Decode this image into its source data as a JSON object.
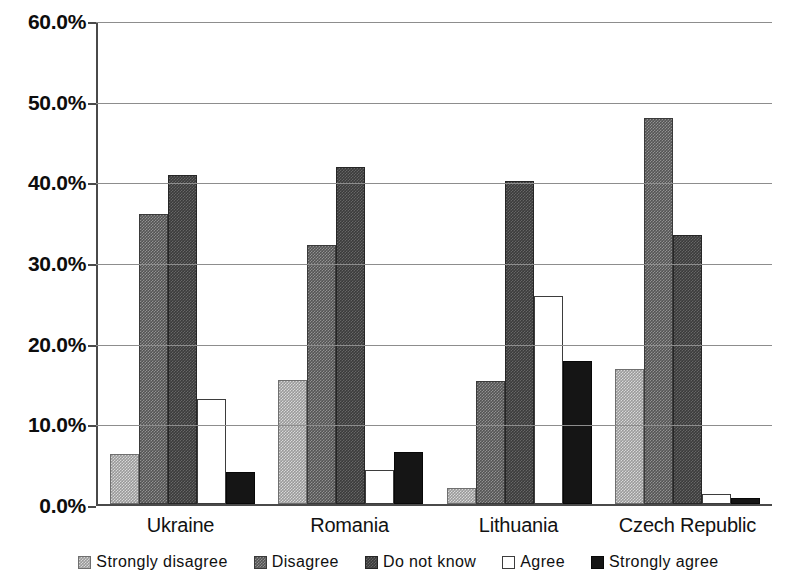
{
  "chart_data": {
    "type": "bar",
    "title": "",
    "subtitle": "",
    "xlabel": "",
    "ylabel": "",
    "ylim": [
      0,
      60
    ],
    "ytick_labels": [
      "0.0%",
      "10.0%",
      "20.0%",
      "30.0%",
      "40.0%",
      "50.0%",
      "60.0%"
    ],
    "ytick_values": [
      0,
      10,
      20,
      30,
      40,
      50,
      60
    ],
    "grid": true,
    "legend_position": "bottom",
    "categories": [
      "Ukraine",
      "Romania",
      "Lithuania",
      "Czech Republic"
    ],
    "series": [
      {
        "name": "Strongly disagree",
        "swatch": "light-gray-checker",
        "color": "#9a9a9a",
        "values": [
          6.2,
          15.4,
          2.0,
          16.7
        ]
      },
      {
        "name": "Disagree",
        "swatch": "medium-gray-checker",
        "color": "#545454",
        "values": [
          35.9,
          32.1,
          15.2,
          47.9
        ]
      },
      {
        "name": "Do not know",
        "swatch": "dark-gray-checker",
        "color": "#3b3b3b",
        "values": [
          40.8,
          41.8,
          40.0,
          33.4
        ]
      },
      {
        "name": "Agree",
        "swatch": "white-outline",
        "color": "#ffffff",
        "values": [
          13.0,
          4.2,
          25.8,
          1.2
        ]
      },
      {
        "name": "Strongly agree",
        "swatch": "solid-black",
        "color": "#151515",
        "values": [
          4.0,
          6.5,
          17.7,
          0.7
        ]
      }
    ]
  },
  "axis": {
    "y_labels": [
      "60.0%",
      "50.0%",
      "40.0%",
      "30.0%",
      "20.0%",
      "10.0%",
      "0.0%"
    ]
  },
  "legend": {
    "items": [
      {
        "label": "Strongly disagree"
      },
      {
        "label": "Disagree"
      },
      {
        "label": "Do not know"
      },
      {
        "label": "Agree"
      },
      {
        "label": "Strongly agree"
      }
    ]
  }
}
